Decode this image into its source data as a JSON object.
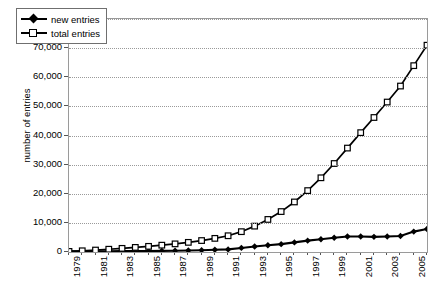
{
  "chart_data": {
    "type": "line",
    "title": "",
    "xlabel": "",
    "ylabel": "number of entries",
    "ylim": [
      0,
      80000
    ],
    "ytick_labels": [
      "0",
      "10,000",
      "20,000",
      "30,000",
      "40,000",
      "50,000",
      "60,000",
      "70,000",
      "80,000"
    ],
    "ytick_values": [
      0,
      10000,
      20000,
      30000,
      40000,
      50000,
      60000,
      70000,
      80000
    ],
    "grid": "horizontal-dotted",
    "legend_position": "top-left-inside",
    "x": [
      1979,
      1980,
      1981,
      1982,
      1983,
      1984,
      1985,
      1986,
      1987,
      1988,
      1989,
      1990,
      1991,
      1992,
      1993,
      1994,
      1995,
      1996,
      1997,
      1998,
      1999,
      2000,
      2001,
      2002,
      2003,
      2004,
      2005,
      2006
    ],
    "xtick_labels": [
      "1979",
      "",
      "1981",
      "",
      "1983",
      "",
      "1985",
      "",
      "1987",
      "",
      "1989",
      "",
      "1991",
      "",
      "1993",
      "",
      "1995",
      "",
      "1997",
      "",
      "1999",
      "",
      "2001",
      "",
      "2003",
      "",
      "2005",
      ""
    ],
    "xlim": [
      1979,
      2006
    ],
    "series": [
      {
        "name": "new entries",
        "marker": "filled-diamond",
        "color": "#000000",
        "values": [
          200,
          220,
          250,
          280,
          300,
          330,
          360,
          400,
          450,
          520,
          620,
          750,
          900,
          1400,
          1900,
          2300,
          2700,
          3300,
          3900,
          4400,
          4900,
          5300,
          5300,
          5200,
          5300,
          5500,
          7000,
          7900
        ]
      },
      {
        "name": "total entries",
        "marker": "open-square",
        "color": "#000000",
        "values": [
          200,
          420,
          670,
          950,
          1250,
          1580,
          1940,
          2340,
          2790,
          3310,
          3930,
          4680,
          5580,
          6980,
          8880,
          11180,
          13880,
          17180,
          21080,
          25480,
          30380,
          35680,
          40980,
          46180,
          51480,
          56980,
          63980,
          71000
        ]
      }
    ]
  },
  "legend": {
    "items": [
      {
        "label": "new entries",
        "marker": "filled-diamond"
      },
      {
        "label": "total entries",
        "marker": "open-square"
      }
    ]
  },
  "axes": {
    "y_title": "number of entries"
  }
}
